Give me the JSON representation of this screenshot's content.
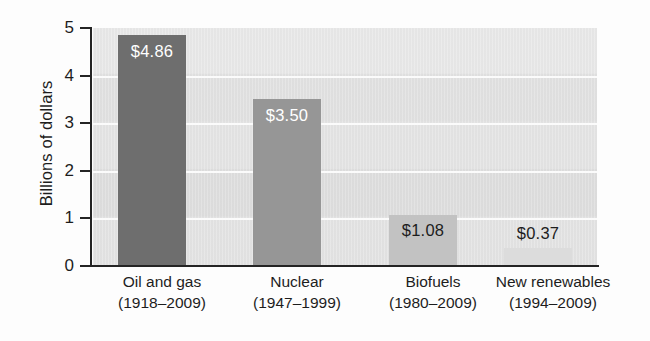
{
  "chart_data": {
    "type": "bar",
    "title": "",
    "xlabel": "",
    "ylabel": "Billions of dollars",
    "ylim": [
      0,
      5
    ],
    "ytick_labels": [
      "0",
      "1",
      "2",
      "3",
      "4",
      "5"
    ],
    "yticks": [
      0,
      1,
      2,
      3,
      4,
      5
    ],
    "grid": true,
    "legend": "none",
    "categories": [
      "Oil and gas",
      "Nuclear",
      "Biofuels",
      "New renewables"
    ],
    "category_sublabels": [
      "(1918–2009)",
      "(1947–1999)",
      "(1980–2009)",
      "(1994–2009)"
    ],
    "values": [
      4.86,
      3.5,
      1.08,
      0.37
    ],
    "value_labels": [
      "$4.86",
      "$3.50",
      "$1.08",
      "$0.37"
    ],
    "bar_colors": [
      "#6e6e6e",
      "#969696",
      "#c2c2c2",
      "#dcdcdc"
    ],
    "label_colors": [
      "#ffffff",
      "#ffffff",
      "#1d1d1d",
      "#1d1d1d"
    ],
    "label_placement": [
      "inside",
      "inside",
      "inside",
      "above"
    ],
    "plot_background": "#e2e2e2",
    "gridline_color": "#fbfbfb",
    "axis_color": "#242424"
  }
}
